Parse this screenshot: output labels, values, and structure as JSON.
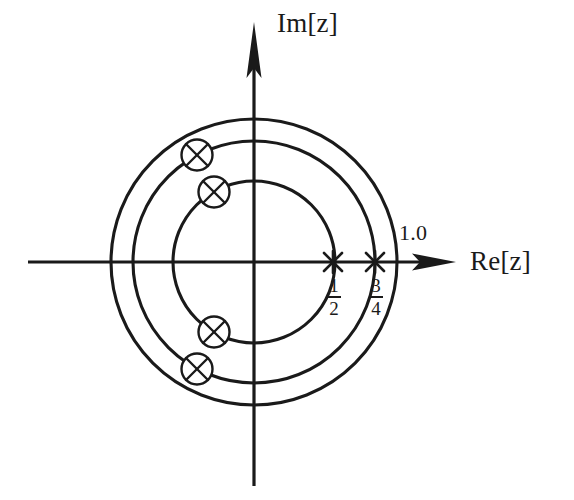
{
  "figure": {
    "kind": "z-plane-pole-diagram",
    "background_color": "#ffffff",
    "ink_color": "#1a1a1a"
  },
  "labels": {
    "imaginary_axis": "Im[z]",
    "real_axis": "Re[z]",
    "unit_circle": "1.0",
    "half": {
      "numerator": "1",
      "denominator": "2"
    },
    "three_quarter": {
      "numerator": "3",
      "denominator": "4"
    }
  },
  "chart_data": {
    "type": "scatter",
    "title": "",
    "xlabel": "Re[z]",
    "ylabel": "Im[z]",
    "xlim": [
      -1.58,
      1.58
    ],
    "ylim": [
      -1.38,
      1.38
    ],
    "grid": false,
    "legend": null,
    "origin_px": {
      "x": 254,
      "y": 262
    },
    "pixels_per_unit": 143,
    "circles": [
      {
        "name": "unit-circle",
        "radius": 1.0,
        "radius_px": 143,
        "label": "1.0"
      },
      {
        "name": "outer-pole-circle",
        "radius": 0.845,
        "radius_px": 121,
        "label": ""
      },
      {
        "name": "inner-pole-circle",
        "radius": 0.566,
        "radius_px": 81,
        "label": ""
      }
    ],
    "axis_marks": [
      {
        "name": "mark-half",
        "symbol": "x",
        "re": 0.5,
        "im": 0.0,
        "label": "1/2",
        "x_px": 333,
        "y_px": 262
      },
      {
        "name": "mark-three-quarter",
        "symbol": "x",
        "re": 0.75,
        "im": 0.0,
        "label": "3/4",
        "x_px": 375,
        "y_px": 262
      }
    ],
    "poles": [
      {
        "name": "pole-1",
        "symbol": "circled-x",
        "re": -0.4,
        "im": 0.745,
        "x_px": 197,
        "y_px": 155,
        "on_circle": "outer-pole-circle"
      },
      {
        "name": "pole-2",
        "symbol": "circled-x",
        "re": -0.28,
        "im": 0.49,
        "x_px": 214,
        "y_px": 192,
        "on_circle": "inner-pole-circle"
      },
      {
        "name": "pole-3",
        "symbol": "circled-x",
        "re": -0.28,
        "im": -0.49,
        "x_px": 214,
        "y_px": 332,
        "on_circle": "inner-pole-circle"
      },
      {
        "name": "pole-4",
        "symbol": "circled-x",
        "re": -0.4,
        "im": -0.745,
        "x_px": 197,
        "y_px": 369,
        "on_circle": "outer-pole-circle"
      }
    ]
  }
}
